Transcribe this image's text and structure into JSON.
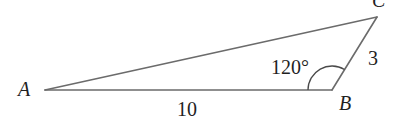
{
  "diagram": {
    "type": "triangle",
    "vertices": {
      "A": {
        "label": "A",
        "x": 45,
        "y": 90
      },
      "B": {
        "label": "B",
        "x": 332,
        "y": 90
      },
      "C": {
        "label": "C",
        "x": 377,
        "y": 17
      }
    },
    "sides": {
      "AB": {
        "label": "10"
      },
      "BC": {
        "label": "3"
      }
    },
    "angles": {
      "B": {
        "label": "120°",
        "degrees": 120
      }
    },
    "colors": {
      "stroke": "#6b6b6b",
      "text": "#1f1f1f",
      "background": "#ffffff"
    }
  }
}
